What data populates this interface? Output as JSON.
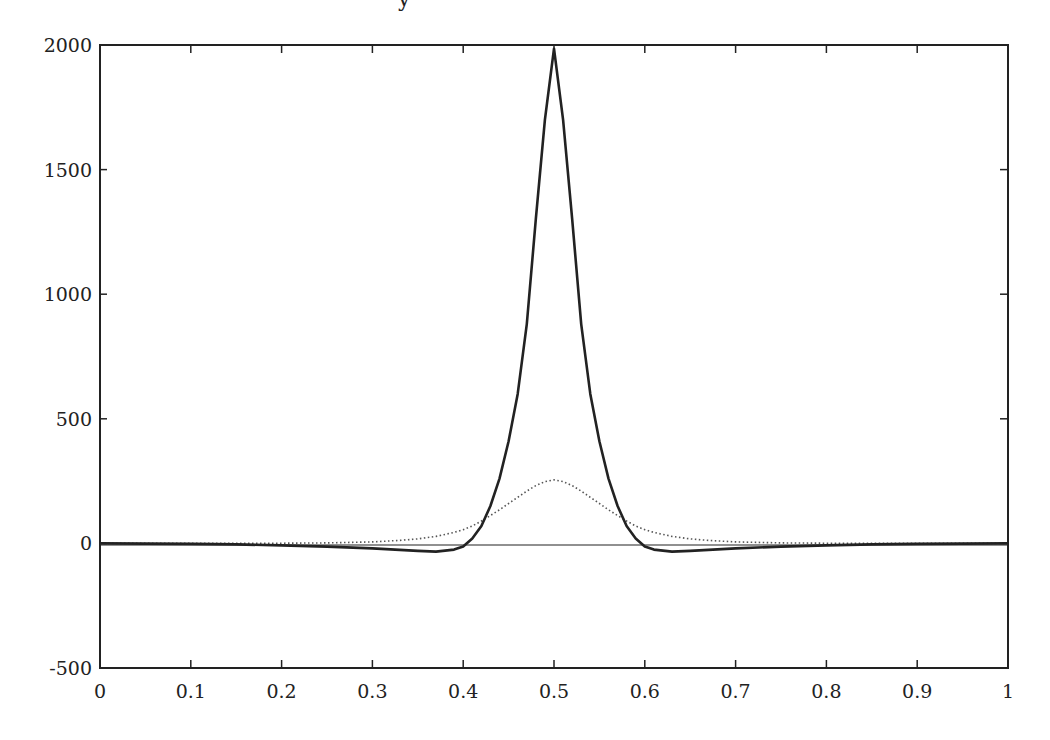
{
  "chart_data": {
    "type": "line",
    "title": "",
    "title_fragment": "y",
    "xlabel": "",
    "ylabel": "",
    "xlim": [
      0,
      1
    ],
    "ylim": [
      -500,
      2000
    ],
    "grid": false,
    "legend": null,
    "x_ticks": [
      "0",
      "0.1",
      "0.2",
      "0.3",
      "0.4",
      "0.5",
      "0.6",
      "0.7",
      "0.8",
      "0.9",
      "1"
    ],
    "y_ticks": [
      "-500",
      "0",
      "500",
      "1000",
      "1500",
      "2000"
    ],
    "series": [
      {
        "name": "solid",
        "style": "solid",
        "color": "#222222",
        "x": [
          0,
          0.05,
          0.1,
          0.15,
          0.2,
          0.25,
          0.3,
          0.33,
          0.35,
          0.37,
          0.39,
          0.4,
          0.41,
          0.42,
          0.43,
          0.44,
          0.45,
          0.46,
          0.47,
          0.48,
          0.49,
          0.5,
          0.51,
          0.52,
          0.53,
          0.54,
          0.55,
          0.56,
          0.57,
          0.58,
          0.59,
          0.6,
          0.61,
          0.63,
          0.65,
          0.67,
          0.7,
          0.75,
          0.8,
          0.85,
          0.9,
          0.95,
          1
        ],
        "y": [
          0,
          -1,
          -2,
          -4,
          -8,
          -13,
          -20,
          -26,
          -30,
          -33,
          -25,
          -12,
          20,
          70,
          150,
          260,
          410,
          600,
          880,
          1300,
          1700,
          1985,
          1700,
          1300,
          880,
          600,
          410,
          260,
          150,
          70,
          20,
          -12,
          -25,
          -33,
          -30,
          -26,
          -20,
          -13,
          -8,
          -4,
          -2,
          -1,
          0
        ]
      },
      {
        "name": "dotted",
        "style": "dotted",
        "color": "#555555",
        "x": [
          0,
          0.1,
          0.2,
          0.25,
          0.3,
          0.33,
          0.35,
          0.37,
          0.39,
          0.4,
          0.41,
          0.42,
          0.43,
          0.44,
          0.45,
          0.46,
          0.47,
          0.48,
          0.49,
          0.5,
          0.51,
          0.52,
          0.53,
          0.54,
          0.55,
          0.56,
          0.57,
          0.58,
          0.59,
          0.6,
          0.61,
          0.63,
          0.65,
          0.67,
          0.7,
          0.75,
          0.8,
          0.9,
          1
        ],
        "y": [
          0,
          0,
          1,
          2,
          6,
          12,
          18,
          28,
          44,
          55,
          70,
          90,
          112,
          135,
          160,
          185,
          210,
          232,
          248,
          255,
          248,
          232,
          210,
          185,
          160,
          135,
          112,
          90,
          70,
          55,
          44,
          28,
          18,
          12,
          6,
          2,
          1,
          0,
          0
        ]
      }
    ]
  }
}
